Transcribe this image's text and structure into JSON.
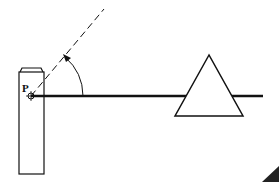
{
  "diagram": {
    "point_label": "P",
    "colors": {
      "stroke": "#111111",
      "background": "#ffffff"
    },
    "elements": [
      "vertical post with cap",
      "point P marked with circled crosshair",
      "thick horizontal line from P to the right",
      "dashed line from P at an angle upward-right",
      "angle arc with arrow from horizontal to dashed line",
      "triangle (fulcrum/prism) on horizontal line"
    ]
  }
}
